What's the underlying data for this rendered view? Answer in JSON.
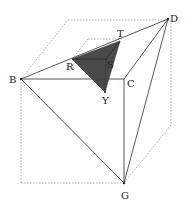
{
  "diagram": {
    "points": {
      "B": {
        "label": "B",
        "x": 21,
        "y": 79
      },
      "C": {
        "label": "C",
        "x": 124,
        "y": 79
      },
      "D": {
        "label": "D",
        "x": 168,
        "y": 19
      },
      "G": {
        "label": "G",
        "x": 124,
        "y": 183
      },
      "R": {
        "label": "R",
        "x": 72,
        "y": 59
      },
      "S": {
        "label": "S",
        "x": 106,
        "y": 59
      },
      "T": {
        "label": "T",
        "x": 120,
        "y": 41
      },
      "Y": {
        "label": "Y",
        "x": 105,
        "y": 92
      }
    },
    "shaded_region": [
      "R",
      "T",
      "Y"
    ],
    "colors": {
      "shade": "#4a4a4a",
      "solid_edge": "#444444",
      "hidden_edge": "#aaaaaa"
    }
  }
}
